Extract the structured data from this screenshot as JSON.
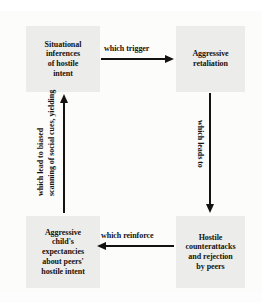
{
  "diagram": {
    "type": "cyclical-flow",
    "background_color": "#fbfbfa",
    "node_fill_color": "#ececeb",
    "text_color": "#16130f",
    "arrow_color": "#14120f",
    "nodes": [
      {
        "id": "situational",
        "name": "situational-inferences-node",
        "lines": [
          "Situational",
          "inferences",
          "of hostile",
          "intent"
        ],
        "position": "top-left"
      },
      {
        "id": "retaliation",
        "name": "aggressive-retaliation-node",
        "lines": [
          "Aggressive",
          "retaliation"
        ],
        "position": "top-right"
      },
      {
        "id": "counterattacks",
        "name": "hostile-counterattacks-node",
        "lines": [
          "Hostile",
          "counterattacks",
          "and rejection",
          "by peers"
        ],
        "position": "bottom-right"
      },
      {
        "id": "expectancies",
        "name": "aggressive-child-expectancies-node",
        "lines": [
          "Aggressive",
          "child's",
          "expectancies",
          "about peers'",
          "hostile intent"
        ],
        "position": "bottom-left"
      }
    ],
    "edges": [
      {
        "id": "trigger",
        "label": "which trigger",
        "from": "situational",
        "to": "retaliation",
        "direction": "right"
      },
      {
        "id": "leads",
        "label": "which leads to",
        "from": "retaliation",
        "to": "counterattacks",
        "direction": "down"
      },
      {
        "id": "reinforce",
        "label": "which reinforce",
        "from": "counterattacks",
        "to": "expectancies",
        "direction": "left"
      },
      {
        "id": "scan",
        "label_line_1": "which lead to biased",
        "label_line_2": "scanning of social",
        "label_line_2_full": "scanning of social cues, yielding",
        "from": "expectancies",
        "to": "situational",
        "direction": "up"
      }
    ]
  }
}
